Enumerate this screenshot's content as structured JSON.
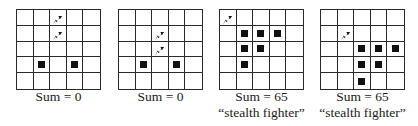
{
  "panels": [
    {
      "caption_sum": "Sum = 0",
      "caption_label": "",
      "jets": [
        [
          0,
          2
        ],
        [
          1,
          2
        ]
      ],
      "squares": [
        [
          3,
          1
        ],
        [
          3,
          3
        ]
      ]
    },
    {
      "caption_sum": "Sum = 0",
      "caption_label": "",
      "jets": [
        [
          1,
          2
        ],
        [
          2,
          2
        ]
      ],
      "squares": [
        [
          3,
          1
        ],
        [
          3,
          3
        ]
      ]
    },
    {
      "caption_sum": "Sum = 65",
      "caption_label": "“stealth fighter”",
      "jets": [
        [
          0,
          0
        ]
      ],
      "squares": [
        [
          1,
          1
        ],
        [
          1,
          2
        ],
        [
          1,
          3
        ],
        [
          2,
          1
        ],
        [
          2,
          2
        ],
        [
          3,
          1
        ]
      ]
    },
    {
      "caption_sum": "Sum = 65",
      "caption_label": "“stealth fighter”",
      "jets": [
        [
          1,
          1
        ]
      ],
      "squares": [
        [
          2,
          2
        ],
        [
          2,
          3
        ],
        [
          2,
          4
        ],
        [
          3,
          2
        ],
        [
          3,
          3
        ],
        [
          4,
          2
        ]
      ]
    }
  ],
  "grid": {
    "rows": 5,
    "cols": 5
  },
  "icons": {
    "jet": "jet-icon",
    "square": "filled-square"
  }
}
